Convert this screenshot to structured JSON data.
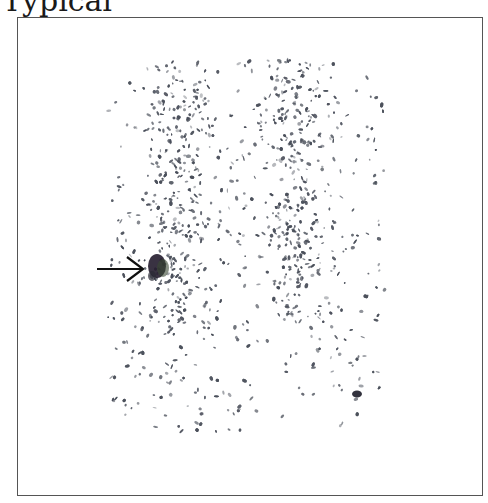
{
  "caption": "Typical",
  "figure": {
    "type": "scintigraphy-scan",
    "annotation": {
      "icon": "arrow-right-icon",
      "points_to": "focal hot spot, left lower column"
    },
    "colors": {
      "frame": "#555555",
      "dots": "#4a4f5a",
      "hot_spot": "#1e1a2a",
      "background": "#ffffff"
    }
  }
}
